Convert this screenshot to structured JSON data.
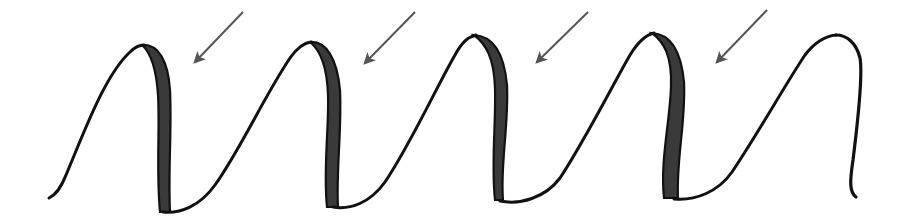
{
  "figure": {
    "title": "Calligraphy wave with shaded downstrokes",
    "colors": {
      "background": "#ffffff",
      "outline": "#111111",
      "shade_fill": "#3a3a3a",
      "arrow": "#555555"
    }
  },
  "wave": {
    "start": [
      48,
      198
    ],
    "humps": [
      {
        "peak": [
          150,
          45
        ],
        "trough": [
          165,
          212
        ],
        "shaded": true
      },
      {
        "peak": [
          318,
          42
        ],
        "trough": [
          335,
          207
        ],
        "shaded": true
      },
      {
        "peak": [
          480,
          35
        ],
        "trough": [
          505,
          202
        ],
        "shaded": true
      },
      {
        "peak": [
          655,
          35
        ],
        "trough": [
          675,
          200
        ],
        "shaded": true
      },
      {
        "peak": [
          838,
          35
        ],
        "trough": [
          852,
          197
        ],
        "shaded": false
      }
    ]
  },
  "arrows": [
    {
      "label": "arrow 1",
      "from": [
        243,
        12
      ],
      "to": [
        195,
        62
      ]
    },
    {
      "label": "arrow 2",
      "from": [
        415,
        12
      ],
      "to": [
        365,
        63
      ]
    },
    {
      "label": "arrow 3",
      "from": [
        588,
        12
      ],
      "to": [
        537,
        62
      ]
    },
    {
      "label": "arrow 4",
      "from": [
        767,
        10
      ],
      "to": [
        717,
        62
      ]
    }
  ]
}
